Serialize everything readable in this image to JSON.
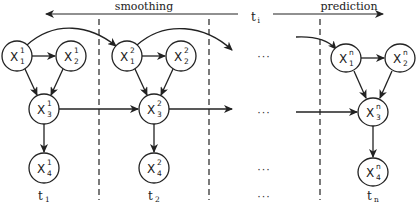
{
  "diagram": {
    "type": "dynamic-bayesian-network",
    "phases": {
      "smoothing": "smoothing",
      "prediction": "prediction",
      "current_time": "t",
      "current_time_sub": "i"
    },
    "ellipsis": "···",
    "columns": [
      {
        "id": "slice-1",
        "time_label": "t",
        "time_sub": "1",
        "nodes": [
          {
            "var": "X",
            "sub": "1",
            "sup": "1"
          },
          {
            "var": "X",
            "sub": "2",
            "sup": "1"
          },
          {
            "var": "X",
            "sub": "3",
            "sup": "1"
          },
          {
            "var": "X",
            "sub": "4",
            "sup": "1"
          }
        ]
      },
      {
        "id": "slice-2",
        "time_label": "t",
        "time_sub": "2",
        "nodes": [
          {
            "var": "X",
            "sub": "1",
            "sup": "2"
          },
          {
            "var": "X",
            "sub": "2",
            "sup": "2"
          },
          {
            "var": "X",
            "sub": "3",
            "sup": "2"
          },
          {
            "var": "X",
            "sub": "4",
            "sup": "2"
          }
        ]
      },
      {
        "id": "slice-n",
        "time_label": "t",
        "time_sub": "n",
        "nodes": [
          {
            "var": "X",
            "sub": "1",
            "sup": "n"
          },
          {
            "var": "X",
            "sub": "2",
            "sup": "n"
          },
          {
            "var": "X",
            "sub": "3",
            "sup": "n"
          },
          {
            "var": "X",
            "sub": "4",
            "sup": "n"
          }
        ]
      }
    ],
    "intra_slice_edges": [
      [
        "X1",
        "X2"
      ],
      [
        "X1",
        "X3"
      ],
      [
        "X2",
        "X3"
      ],
      [
        "X3",
        "X4"
      ]
    ],
    "inter_slice_edges": [
      [
        "X1(t)",
        "X1(t+1)"
      ],
      [
        "X3(t)",
        "X3(t+1)"
      ]
    ]
  }
}
